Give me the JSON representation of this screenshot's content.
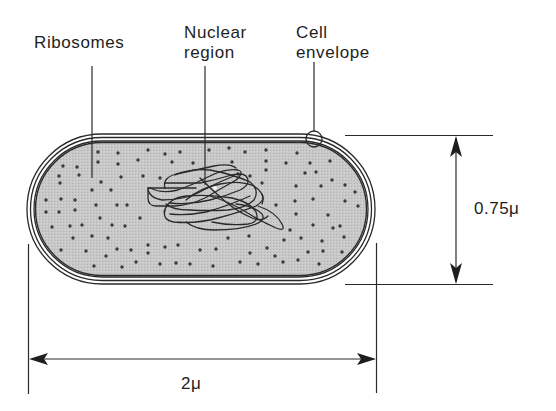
{
  "labels": {
    "ribosomes": "Ribosomes",
    "nuclear_region_line1": "Nuclear",
    "nuclear_region_line2": "region",
    "cell_envelope_line1": "Cell",
    "cell_envelope_line2": "envelope"
  },
  "dimensions": {
    "width": "0.75μ",
    "length": "2μ"
  },
  "colors": {
    "cytoplasm": "#c4c4c4",
    "outline": "#2a2a2a",
    "ribosome": "#3a3a3a",
    "text": "#1e1e1e",
    "background": "#ffffff"
  }
}
